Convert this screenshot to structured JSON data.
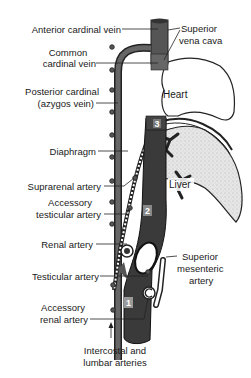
{
  "diagram": {
    "labels_left": {
      "anterior_cardinal_vein": "Anterior cardinal vein",
      "common_cardinal_vein_1": "Common",
      "common_cardinal_vein_2": "cardinal vein",
      "posterior_cardinal_1": "Posterior cardinal",
      "posterior_cardinal_2": "(azygos vein)",
      "diaphragm": "Diaphragm",
      "suprarenal_artery": "Suprarenal artery",
      "accessory_testicular_1": "Accessory",
      "accessory_testicular_2": "testicular artery",
      "renal_artery": "Renal artery",
      "testicular_artery": "Testicular artery",
      "accessory_renal_1": "Accessory",
      "accessory_renal_2": "renal artery"
    },
    "labels_right": {
      "superior_vena_cava_1": "Superior",
      "superior_vena_cava_2": "vena cava",
      "superior_mesenteric_1": "Superior",
      "superior_mesenteric_2": "mesenteric",
      "superior_mesenteric_3": "artery"
    },
    "labels_bottom": {
      "intercostal_1": "Intercostal and",
      "intercostal_2": "lumbar arteries"
    },
    "organ_labels": {
      "heart": "Heart",
      "liver": "Liver"
    },
    "segment_numbers": {
      "seg1": "1",
      "seg2": "2",
      "seg3": "3",
      "seg3_small": "3"
    }
  }
}
